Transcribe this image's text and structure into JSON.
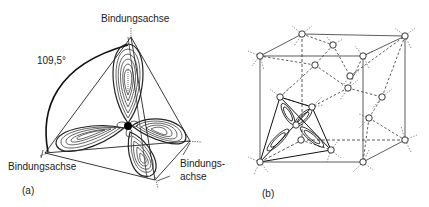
{
  "panel_a": {
    "caption": "(a)",
    "angle_label": "109,5°",
    "axis_label_top": "Bindungsachse",
    "axis_label_left": "Bindungsachse",
    "axis_label_right_1": "Bindungs-",
    "axis_label_right_2": "achse"
  },
  "panel_b": {
    "caption": "(b)"
  }
}
